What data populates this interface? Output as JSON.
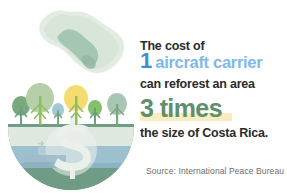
{
  "canvas": {
    "width": 287,
    "height": 196,
    "background_color": "#ffffff"
  },
  "headline": {
    "line1": "The cost of",
    "emphasis_number_1": "1",
    "emphasis_phrase_1": "aircraft carrier",
    "line2": "can reforest an area",
    "emphasis_phrase_2": "3 times",
    "line3": "the size of Costa Rica."
  },
  "source": {
    "text": "Source: International Peace Bureau"
  },
  "colors": {
    "number_blue": "#3d8fd1",
    "phrase_blue": "#7fb9e8",
    "green_emphasis": "#5f8f6e",
    "highlight_yellow": "#f7edbe",
    "body_text": "#2b2b2b",
    "source_text": "#6e6e6e",
    "dome_land": "#6f9c84",
    "dome_water": "#9dc0cf",
    "dome_sky": "#dfe9e0",
    "map_pale_green": "#dce7dc",
    "map_mid_green": "#9cc1ac"
  },
  "illustration": {
    "map_label": "costa-rica-map",
    "dome_label": "reforestation-dome",
    "dollar_label": "dollar-sign",
    "carrier_label": "aircraft-carrier-ship",
    "trees": [
      {
        "name": "tree-1",
        "crown_color": "#7aa87f",
        "trunk_color": "#6f9c84"
      },
      {
        "name": "tree-2",
        "crown_color": "#b6cfa8",
        "trunk_color": "#8fbf5e"
      },
      {
        "name": "tree-3",
        "crown_color": "#9fc9d8",
        "trunk_color": "#7aa87f"
      },
      {
        "name": "tree-4",
        "crown_color": "#f2dd6e",
        "trunk_color": "#8fbf5e"
      },
      {
        "name": "tree-5",
        "crown_color": "#86c06a",
        "trunk_color": "#6f9c84"
      },
      {
        "name": "tree-6",
        "crown_color": "#a9c6b4",
        "trunk_color": "#7aa87f"
      }
    ]
  }
}
